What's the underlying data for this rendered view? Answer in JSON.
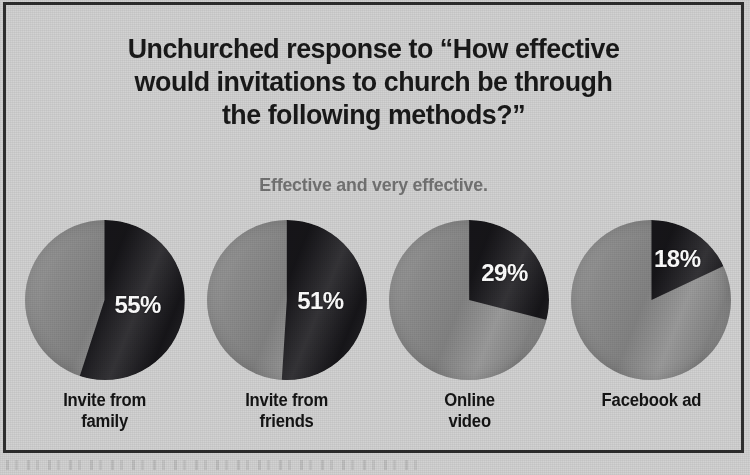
{
  "chart_data": {
    "type": "pie",
    "title": "Unchurched response to “How effective would invitations to church be through the following methods?”",
    "title_lines": [
      "Unchurched response to “How effective",
      "would invitations to church be through",
      "the following methods?”"
    ],
    "subtitle": "Effective and very effective.",
    "xlabel": "",
    "ylabel": "",
    "grid": false,
    "legend": "none",
    "value_unit": "%",
    "categories": [
      "Invite from family",
      "Invite from friends",
      "Online video",
      "Facebook ad"
    ],
    "values": [
      55,
      51,
      29,
      18
    ],
    "series": [
      {
        "name": "Effective and very effective",
        "values": [
          55,
          51,
          29,
          18
        ],
        "color": "#17161a"
      },
      {
        "name": "Remainder",
        "values": [
          45,
          49,
          71,
          82
        ],
        "color": "#8d8d8d"
      }
    ],
    "slices": [
      {
        "category": "Invite from family",
        "label_line1": "Invite from family",
        "label_line2": "",
        "label_wrap": [
          "Invite from",
          "family"
        ],
        "value": 55,
        "value_label": "55%",
        "remainder": 45,
        "start_angle_deg": 0,
        "sweep_angle_deg": 198
      },
      {
        "category": "Invite from friends",
        "label_line1": "Invite from friends",
        "label_line2": "",
        "label_wrap": [
          "Invite from",
          "friends"
        ],
        "value": 51,
        "value_label": "51%",
        "remainder": 49,
        "start_angle_deg": 0,
        "sweep_angle_deg": 183.6
      },
      {
        "category": "Online video",
        "label_line1": "Online video",
        "label_line2": "",
        "label_wrap": [
          "Online",
          "video"
        ],
        "value": 29,
        "value_label": "29%",
        "remainder": 71,
        "start_angle_deg": 0,
        "sweep_angle_deg": 104.4
      },
      {
        "category": "Facebook ad",
        "label_line1": "Facebook ad",
        "label_line2": "",
        "label_wrap": [
          "Facebook ad",
          ""
        ],
        "value": 18,
        "value_label": "18%",
        "remainder": 82,
        "start_angle_deg": 0,
        "sweep_angle_deg": 64.8
      }
    ],
    "colors": {
      "slice_dark": "#17161a",
      "slice_gray": "#8d8d8d",
      "background": "#d2d2d2",
      "title_text": "#191919",
      "subtitle_text": "#737373",
      "label_text": "#141414",
      "value_text": "#ffffff",
      "border": "#2e2e2e"
    }
  }
}
